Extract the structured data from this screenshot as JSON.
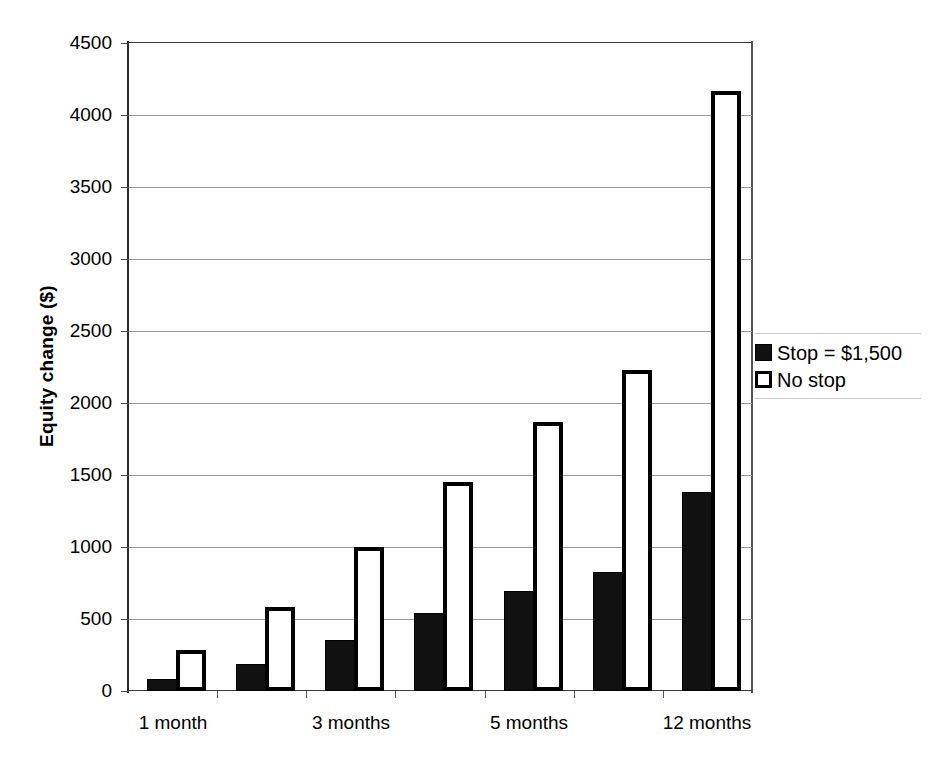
{
  "chart_data": {
    "type": "bar",
    "title": "",
    "xlabel": "",
    "ylabel": "Equity change ($)",
    "ylim": [
      0,
      4500
    ],
    "ytick_step": 500,
    "yticks": [
      "0",
      "500",
      "1000",
      "1500",
      "2000",
      "2500",
      "3000",
      "3500",
      "4000",
      "4500"
    ],
    "grid": "horizontal",
    "legend_position": "right",
    "categories": [
      "1 month",
      "2 months",
      "3 months",
      "4 months",
      "5 months",
      "6 months",
      "12 months"
    ],
    "visible_tick_labels": [
      "1 month",
      "3 months",
      "5 months",
      "12 months"
    ],
    "series": [
      {
        "name": "Stop = $1,500",
        "style": "filled-black",
        "values": [
          80,
          190,
          355,
          540,
          695,
          825,
          1385
        ]
      },
      {
        "name": "No stop",
        "style": "hollow-white",
        "values": [
          285,
          585,
          1000,
          1450,
          1870,
          2230,
          4170
        ]
      }
    ]
  },
  "legend": {
    "items": [
      {
        "label": "Stop = $1,500",
        "swatch": "filled-square-icon"
      },
      {
        "label": "No stop",
        "swatch": "hollow-square-icon"
      }
    ]
  },
  "axes": {
    "y_title": "Equity change ($)",
    "y_tick_labels": [
      "4500",
      "4000",
      "3500",
      "3000",
      "2500",
      "2000",
      "1500",
      "1000",
      "500",
      "0"
    ],
    "x_tick_labels": [
      "1 month",
      "3 months",
      "5 months",
      "12 months"
    ]
  },
  "colors": {
    "series_filled": "#111111",
    "series_hollow_fill": "#ffffff",
    "series_hollow_border": "#000000",
    "gridline": "#9a9a9a",
    "axis": "#2a2a2a",
    "background": "#ffffff",
    "text": "#000000"
  }
}
